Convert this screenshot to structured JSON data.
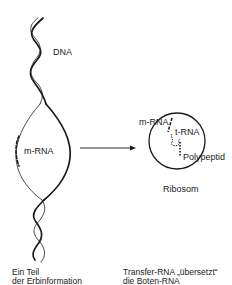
{
  "diagram": {
    "labels": {
      "dna": "DNA",
      "mrna_left": "m-RNA",
      "mrna_ribosome": "m-RNA",
      "trna": "t-RNA",
      "polypeptid": "Polypeptid",
      "ribosom": "Ribosom"
    },
    "captions": {
      "left_line1": "Ein Teil",
      "left_line2": "der Erbinformation",
      "right_line1": "Transfer-RNA „übersetzt“",
      "right_line2": "die Boten-RNA"
    },
    "icons": {
      "dna_helix": "double-helix",
      "arrow": "arrow-right",
      "ribosome": "circle"
    },
    "colors": {
      "ink": "#1a1a1a",
      "background": "#ffffff"
    }
  }
}
